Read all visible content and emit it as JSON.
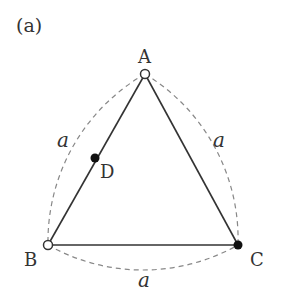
{
  "figure": {
    "panel_label": "(a)",
    "points": {
      "A": {
        "label": "A",
        "x": 145,
        "y": 74,
        "marker": "open"
      },
      "B": {
        "label": "B",
        "x": 48,
        "y": 245,
        "marker": "open"
      },
      "C": {
        "label": "C",
        "x": 238,
        "y": 245,
        "marker": "filled"
      },
      "D": {
        "label": "D",
        "x": 95,
        "y": 158,
        "marker": "filled"
      }
    },
    "side_labels": {
      "left": "a",
      "right": "a",
      "bottom": "a"
    },
    "colors": {
      "line": "#333333",
      "dashed": "#888888",
      "marker_fill": "#111111"
    }
  }
}
